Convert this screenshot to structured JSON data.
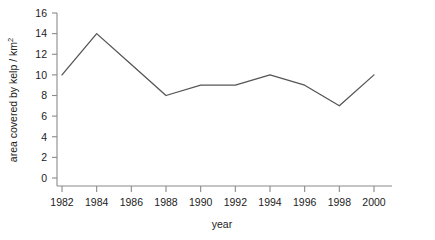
{
  "chart_data": {
    "type": "line",
    "title": "",
    "xlabel": "year",
    "ylabel": "area covered by kelp / km2",
    "ylabel_main": "area covered by kelp / km",
    "ylabel_exponent": "2",
    "x": [
      1982,
      1984,
      1986,
      1988,
      1990,
      1992,
      1994,
      1996,
      1998,
      2000
    ],
    "xtick_labels": [
      "1982",
      "1984",
      "1986",
      "1988",
      "1990",
      "1992",
      "1994",
      "1996",
      "1998",
      "2000"
    ],
    "ytick_labels": [
      "0",
      "2",
      "4",
      "6",
      "8",
      "10",
      "12",
      "14",
      "16"
    ],
    "ytick_values": [
      0,
      2,
      4,
      6,
      8,
      10,
      12,
      14,
      16
    ],
    "xlim": [
      1981,
      2001
    ],
    "ylim": [
      0,
      16
    ],
    "grid": false,
    "legend_position": "inline-right",
    "marker": "x",
    "series": [
      {
        "name": "marine reserve",
        "label": "marine reserve",
        "color": "#555555",
        "values": [
          10,
          14,
          11,
          8,
          9,
          9,
          10,
          9,
          7,
          10
        ]
      },
      {
        "name": "fished area",
        "label": "fished area",
        "color": "#8f8f8f",
        "values": [
          8,
          5,
          4,
          2,
          2,
          3,
          7,
          5,
          3,
          7
        ]
      }
    ]
  },
  "axes": {
    "axis_color": "#8a8a8a",
    "text_color": "#222222"
  }
}
